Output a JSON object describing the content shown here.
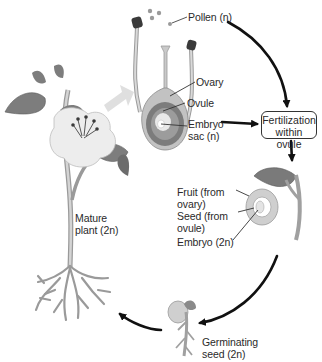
{
  "diagram": {
    "stages": {
      "pollen": {
        "label": "Pollen (n)"
      },
      "ovary": {
        "label": "Ovary"
      },
      "ovule": {
        "label": "Ovule"
      },
      "embryo_sac": {
        "line1": "Embryo",
        "line2": "sac (n)"
      },
      "fertilization": {
        "line1": "Fertilization",
        "line2": "within ovule"
      },
      "fruit": {
        "line1": "Fruit (from",
        "line2": "ovary)"
      },
      "seed": {
        "line1": "Seed (from",
        "line2": "ovule)"
      },
      "embryo": {
        "label": "Embryo (2n)"
      },
      "germinating_seed": {
        "line1": "Germinating",
        "line2": "seed (2n)"
      },
      "mature_plant": {
        "line1": "Mature",
        "line2": "plant (2n)"
      }
    },
    "colors": {
      "arrow": "#111111",
      "plant_fill": "#8a8a8a",
      "flower_fill": "#ececec",
      "ovary_dark": "#7a7a7a",
      "ovary_mid": "#b8b8b8",
      "text": "#2a2a2a"
    }
  }
}
